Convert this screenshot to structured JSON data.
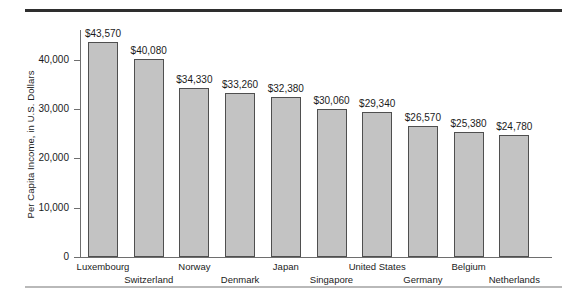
{
  "chart_data": {
    "type": "bar",
    "title": "",
    "xlabel": "",
    "ylabel": "Per Capita Income, in U.S. Dollars",
    "categories": [
      "Luxembourg",
      "Switzerland",
      "Norway",
      "Denmark",
      "Japan",
      "Singapore",
      "United States",
      "Germany",
      "Belgium",
      "Netherlands"
    ],
    "values": [
      43570,
      40080,
      34330,
      33260,
      32380,
      30060,
      29340,
      26570,
      25380,
      24780
    ],
    "value_labels": [
      "$43,570",
      "$40,080",
      "$34,330",
      "$33,260",
      "$32,380",
      "$30,060",
      "$29,340",
      "$26,570",
      "$25,380",
      "$24,780"
    ],
    "ylim": [
      0,
      46000
    ],
    "yticks": [
      0,
      10000,
      20000,
      30000,
      40000
    ],
    "ytick_labels": [
      "0",
      "10,000",
      "20,000",
      "30,000",
      "40,000"
    ],
    "grid": false,
    "legend": false,
    "bar_fill_color": "#c3c3c3",
    "bar_edge_color": "#4f4f4f",
    "axis_color": "#6e6e6e",
    "rule_top_color": "#2e2e2e",
    "rule_bottom_color": "#b9b9b9"
  }
}
